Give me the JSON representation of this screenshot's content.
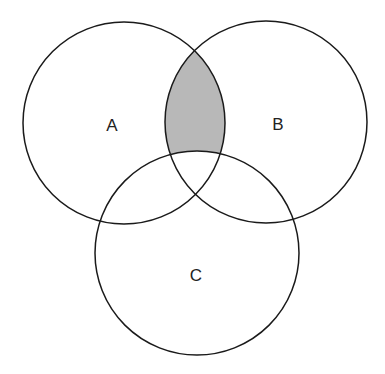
{
  "diagram": {
    "type": "venn",
    "sets": [
      {
        "id": "A",
        "label": "A",
        "cx": 124,
        "cy": 123,
        "r": 101
      },
      {
        "id": "B",
        "label": "B",
        "cx": 266,
        "cy": 122,
        "r": 101
      },
      {
        "id": "C",
        "label": "C",
        "cx": 197,
        "cy": 253,
        "r": 102
      }
    ],
    "shaded_region": "A ∩ B − C",
    "colors": {
      "stroke": "#1a1a1a",
      "shade": "#b8b8b8",
      "background": "#ffffff"
    }
  }
}
